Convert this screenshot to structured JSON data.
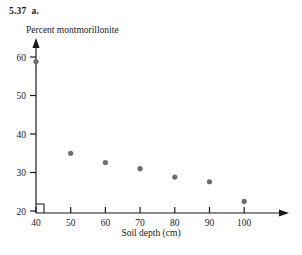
{
  "figure": {
    "exercise_number": "5.37",
    "exercise_part": "a."
  },
  "chart_data": {
    "type": "scatter",
    "title": "",
    "xlabel": "Soil depth (cm)",
    "ylabel": "Percent montmorillonite",
    "x": [
      40,
      50,
      60,
      70,
      80,
      90,
      100
    ],
    "values": [
      58.8,
      35.0,
      32.6,
      31.0,
      28.8,
      27.6,
      22.5
    ],
    "points": [
      {
        "x": 40,
        "y": 58.8
      },
      {
        "x": 50,
        "y": 35.0
      },
      {
        "x": 60,
        "y": 32.6
      },
      {
        "x": 70,
        "y": 31.0
      },
      {
        "x": 80,
        "y": 28.8
      },
      {
        "x": 90,
        "y": 27.6
      },
      {
        "x": 100,
        "y": 22.5
      }
    ],
    "xticks": [
      40,
      50,
      60,
      70,
      80,
      90,
      100
    ],
    "yticks": [
      20,
      30,
      40,
      50,
      60
    ],
    "xlim": [
      36,
      108
    ],
    "ylim": [
      20,
      63
    ],
    "grid": false,
    "legend": null,
    "marker_color": "#6e6e6e",
    "axis_color": "#1a1a1a"
  }
}
